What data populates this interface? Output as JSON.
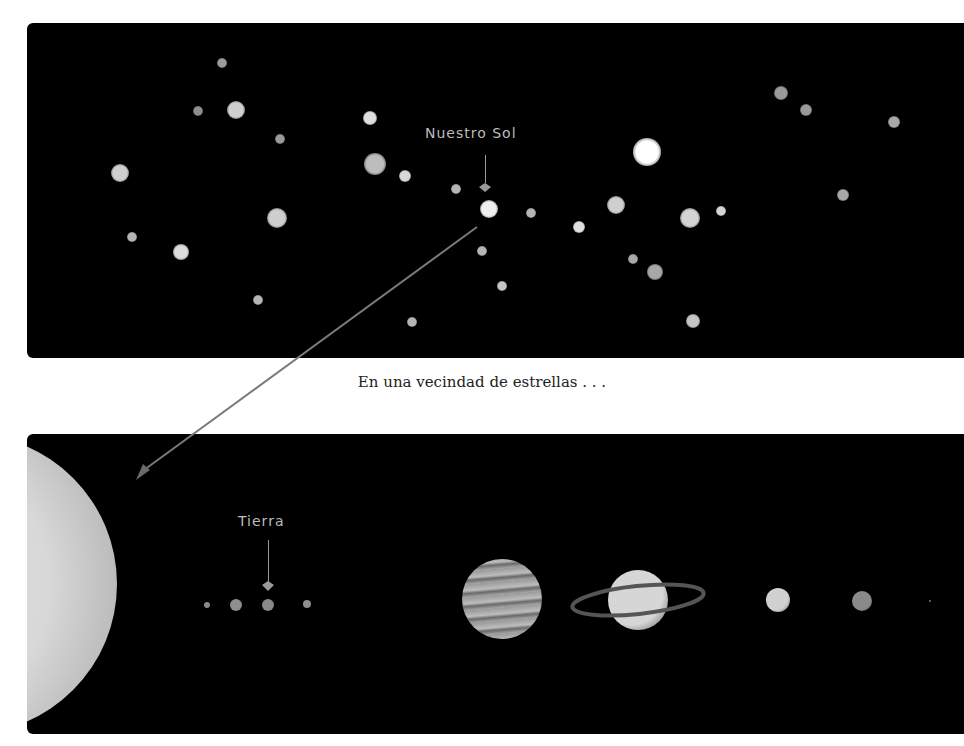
{
  "top_panel": {
    "label": "Nuestro Sol",
    "stars": [
      {
        "x": 222,
        "y": 63,
        "r": 5,
        "c": "#9a9a9a"
      },
      {
        "x": 198,
        "y": 111,
        "r": 5,
        "c": "#8e8e8e"
      },
      {
        "x": 236,
        "y": 110,
        "r": 9,
        "c": "#cfcfcf"
      },
      {
        "x": 280,
        "y": 139,
        "r": 5,
        "c": "#9a9a9a"
      },
      {
        "x": 370,
        "y": 118,
        "r": 7,
        "c": "#e0e0e0"
      },
      {
        "x": 120,
        "y": 173,
        "r": 9,
        "c": "#cfcfcf"
      },
      {
        "x": 375,
        "y": 164,
        "r": 11,
        "c": "#bdbdbd"
      },
      {
        "x": 405,
        "y": 176,
        "r": 6,
        "c": "#d8d8d8"
      },
      {
        "x": 277,
        "y": 218,
        "r": 10,
        "c": "#cfcfcf"
      },
      {
        "x": 132,
        "y": 237,
        "r": 5,
        "c": "#b5b5b5"
      },
      {
        "x": 181,
        "y": 252,
        "r": 8,
        "c": "#dcdcdc"
      },
      {
        "x": 258,
        "y": 300,
        "r": 5,
        "c": "#b5b5b5"
      },
      {
        "x": 412,
        "y": 322,
        "r": 5,
        "c": "#b5b5b5"
      },
      {
        "x": 456,
        "y": 189,
        "r": 5,
        "c": "#b5b5b5"
      },
      {
        "x": 489,
        "y": 209,
        "r": 9,
        "c": "#f0f0f0"
      },
      {
        "x": 531,
        "y": 213,
        "r": 5,
        "c": "#b5b5b5"
      },
      {
        "x": 482,
        "y": 251,
        "r": 5,
        "c": "#b5b5b5"
      },
      {
        "x": 502,
        "y": 286,
        "r": 5,
        "c": "#c5c5c5"
      },
      {
        "x": 579,
        "y": 227,
        "r": 6,
        "c": "#e0e0e0"
      },
      {
        "x": 616,
        "y": 205,
        "r": 9,
        "c": "#cfcfcf"
      },
      {
        "x": 647,
        "y": 152,
        "r": 14,
        "c": "#ffffff"
      },
      {
        "x": 690,
        "y": 218,
        "r": 10,
        "c": "#d4d4d4"
      },
      {
        "x": 721,
        "y": 211,
        "r": 5,
        "c": "#d4d4d4"
      },
      {
        "x": 633,
        "y": 259,
        "r": 5,
        "c": "#a8a8a8"
      },
      {
        "x": 655,
        "y": 272,
        "r": 8,
        "c": "#a8a8a8"
      },
      {
        "x": 693,
        "y": 321,
        "r": 7,
        "c": "#c5c5c5"
      },
      {
        "x": 781,
        "y": 93,
        "r": 7,
        "c": "#9a9a9a"
      },
      {
        "x": 806,
        "y": 110,
        "r": 6,
        "c": "#9a9a9a"
      },
      {
        "x": 894,
        "y": 122,
        "r": 6,
        "c": "#a8a8a8"
      },
      {
        "x": 843,
        "y": 195,
        "r": 6,
        "c": "#a8a8a8"
      }
    ]
  },
  "caption": "En una vecindad de estrellas . . .",
  "bottom_panel": {
    "label": "Tierra",
    "planets": [
      {
        "name": "mercury",
        "x": 207,
        "y": 605,
        "r": 3,
        "c": "#8a8a8a"
      },
      {
        "name": "venus",
        "x": 236,
        "y": 605,
        "r": 6,
        "c": "#8f8f8f"
      },
      {
        "name": "earth",
        "x": 268,
        "y": 605,
        "r": 6,
        "c": "#8a8a8a"
      },
      {
        "name": "mars",
        "x": 307,
        "y": 604,
        "r": 4,
        "c": "#8f8f8f"
      },
      {
        "name": "jupiter",
        "x": 502,
        "y": 599,
        "r": 40,
        "c": "#8c8c8c"
      },
      {
        "name": "saturn",
        "x": 638,
        "y": 600,
        "r": 30,
        "c": "#d6d6d6"
      },
      {
        "name": "uranus",
        "x": 778,
        "y": 600,
        "r": 12,
        "c": "#d0d0d0"
      },
      {
        "name": "neptune",
        "x": 862,
        "y": 601,
        "r": 10,
        "c": "#8a8a8a"
      },
      {
        "name": "pluto",
        "x": 930,
        "y": 601,
        "r": 1,
        "c": "#777777"
      }
    ]
  }
}
